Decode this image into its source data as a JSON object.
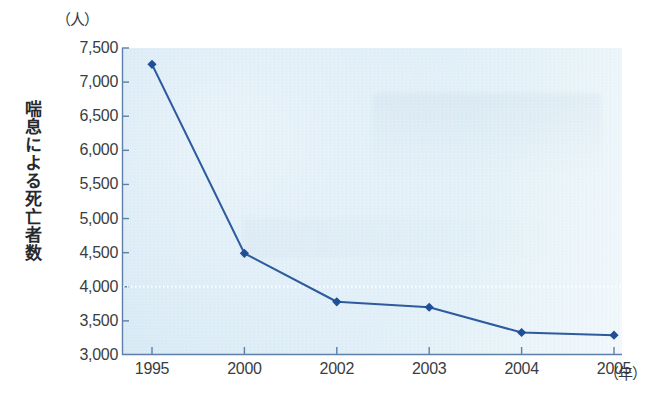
{
  "chart_data": {
    "type": "line",
    "title": "",
    "xlabel": "年",
    "ylabel": "喘息による死亡者数",
    "y_unit": "（人）",
    "x_unit": "（年）",
    "categories": [
      "1995",
      "2000",
      "2002",
      "2003",
      "2004",
      "2005"
    ],
    "values": [
      7260,
      4490,
      3780,
      3700,
      3330,
      3290
    ],
    "series": [
      {
        "name": "喘息による死亡者数",
        "values": [
          7260,
          4490,
          3780,
          3700,
          3330,
          3290
        ]
      }
    ],
    "ylim": [
      3000,
      7500
    ],
    "yticks": [
      3000,
      3500,
      4000,
      4500,
      5000,
      5500,
      6000,
      6500,
      7000,
      7500
    ],
    "ytick_labels": [
      "3,000",
      "3,500",
      "4,000",
      "4,500",
      "5,000",
      "5,500",
      "6,000",
      "6,500",
      "7,000",
      "7,500"
    ],
    "grid": "dotted-horizontal-at-4000",
    "legend": "none",
    "marker": "diamond",
    "line_color": "#2d5b9e",
    "marker_color": "#1f4f96",
    "plot_background": "#dcecf6"
  }
}
